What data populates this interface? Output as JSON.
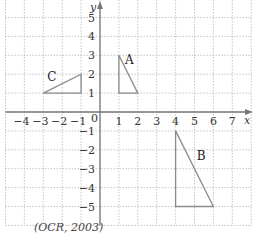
{
  "figure": {
    "x_axis_label": "x",
    "y_axis_label": "y",
    "origin_label": "0",
    "x_ticks": [
      "-4",
      "-3",
      "-2",
      "-1",
      "1",
      "2",
      "3",
      "4",
      "5",
      "6",
      "7"
    ],
    "y_ticks": [
      "5",
      "4",
      "3",
      "2",
      "1",
      "-1",
      "-2",
      "-3",
      "-4",
      "-5"
    ],
    "xlim": [
      -5,
      8
    ],
    "ylim": [
      -6,
      6
    ],
    "grid": true,
    "shapes": [
      {
        "label": "A",
        "vertices": [
          [
            1,
            3
          ],
          [
            1,
            1
          ],
          [
            2,
            1
          ]
        ]
      },
      {
        "label": "B",
        "vertices": [
          [
            4,
            -1
          ],
          [
            4,
            -5
          ],
          [
            6,
            -5
          ]
        ]
      },
      {
        "label": "C",
        "vertices": [
          [
            -3,
            1
          ],
          [
            -1,
            1
          ],
          [
            -1,
            2
          ]
        ]
      }
    ],
    "source": "(OCR, 2003)",
    "colors": {
      "grid": "#b8b8b8",
      "axes": "#777777",
      "shapes": "#8a8a8a"
    }
  }
}
